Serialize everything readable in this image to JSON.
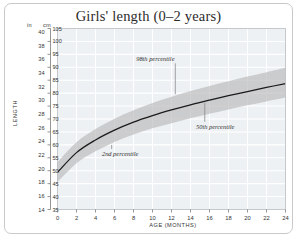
{
  "figure": {
    "title": "Girls' length (0–2 years)",
    "units": {
      "left_unit": "in",
      "right_unit": "cm"
    },
    "axis": {
      "ylabel": "LENGTH",
      "xlabel": "AGE (MONTHS)"
    },
    "colors": {
      "plot_background": "#eef1f4",
      "gridline": "#ffffff",
      "band_fill": "#b4b4b4",
      "median_line": "#1a1a1a",
      "frame_border": "#c9c9c9",
      "text": "#333333"
    }
  },
  "chart_data": {
    "type": "area",
    "title": "Girls' length (0–2 years)",
    "xlabel": "AGE (MONTHS)",
    "ylabel": "LENGTH",
    "xlim": [
      0,
      24
    ],
    "ylim": [
      35,
      105
    ],
    "ylim_inches": [
      14,
      40.5
    ],
    "grid": true,
    "legend": "none",
    "x_unit": "months",
    "y_unit": "cm",
    "y_unit_secondary": "in",
    "x": [
      0,
      2,
      4,
      6,
      8,
      10,
      12,
      14,
      16,
      18,
      20,
      22,
      24
    ],
    "xticks": [
      0,
      2,
      4,
      6,
      8,
      10,
      12,
      14,
      16,
      18,
      20,
      22,
      24
    ],
    "yticks_cm": [
      35,
      40,
      45,
      50,
      55,
      60,
      65,
      70,
      75,
      80,
      85,
      90,
      95,
      100,
      105
    ],
    "yticks_in": [
      14,
      16,
      18,
      20,
      22,
      24,
      26,
      28,
      30,
      32,
      34,
      36,
      38,
      40
    ],
    "series": [
      {
        "name": "2nd percentile",
        "role": "band-lower",
        "values": [
          45.6,
          52.9,
          57.5,
          61.1,
          64.0,
          66.4,
          68.4,
          70.3,
          72.0,
          73.7,
          75.3,
          76.8,
          78.3
        ]
      },
      {
        "name": "50th percentile",
        "role": "median",
        "values": [
          49.4,
          57.0,
          61.9,
          65.7,
          68.8,
          71.3,
          73.5,
          75.5,
          77.3,
          79.0,
          80.6,
          82.2,
          83.7
        ]
      },
      {
        "name": "98th percentile",
        "role": "band-upper",
        "values": [
          53.3,
          61.0,
          66.1,
          70.1,
          73.4,
          76.2,
          78.6,
          80.8,
          82.8,
          84.6,
          86.4,
          88.1,
          89.8
        ]
      }
    ],
    "annotations": [
      {
        "text": "98th percentile",
        "x": 10.3,
        "y": 92.5,
        "points_to_series": "98th percentile",
        "points_to_x": 12.4
      },
      {
        "text": "50th percentile",
        "x": 16.6,
        "y": 66.0,
        "points_to_series": "50th percentile",
        "points_to_x": 15.5
      },
      {
        "text": "2nd percentile",
        "x": 6.6,
        "y": 55.5,
        "points_to_series": "2nd percentile",
        "points_to_x": 5.7
      }
    ]
  }
}
